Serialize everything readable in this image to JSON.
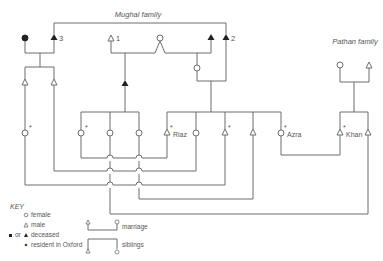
{
  "diagram": {
    "type": "kinship-chart",
    "families": [
      {
        "label": "Mughal family"
      },
      {
        "label": "Pathan family"
      }
    ],
    "numbered_individuals": [
      "1",
      "2",
      "3"
    ],
    "named_individuals": [
      "Riaz",
      "Azra",
      "Khan"
    ],
    "resident_marker": "*"
  },
  "key": {
    "title": "KEY",
    "female": "female",
    "male": "male",
    "deceased_prefix": "or",
    "deceased": "deceased",
    "resident": "resident in Oxford",
    "marriage": "marriage",
    "siblings": "siblings"
  },
  "colors": {
    "line": "#6d6d6d",
    "text": "#555555",
    "background": "#ffffff"
  }
}
